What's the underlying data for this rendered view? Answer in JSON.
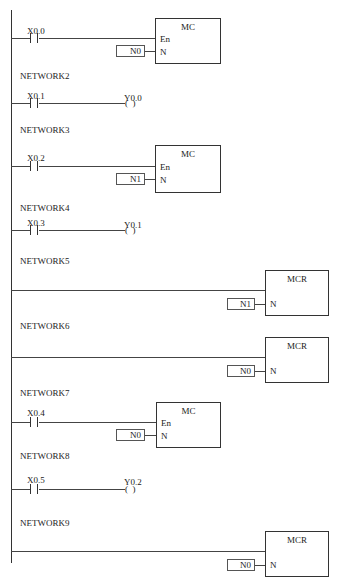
{
  "diagram": {
    "type": "PLC ladder diagram",
    "networks": [
      {
        "id": 1,
        "label": "",
        "contact": "X0.0",
        "instruction": "MC",
        "pins": [
          "En",
          "N"
        ],
        "param": "N0"
      },
      {
        "id": 2,
        "label": "NETWORK2",
        "contact": "X0.1",
        "coil": "Y0.0"
      },
      {
        "id": 3,
        "label": "NETWORK3",
        "contact": "X0.2",
        "instruction": "MC",
        "pins": [
          "En",
          "N"
        ],
        "param": "N1"
      },
      {
        "id": 4,
        "label": "NETWORK4",
        "contact": "X0.3",
        "coil": "Y0.1"
      },
      {
        "id": 5,
        "label": "NETWORK5",
        "instruction": "MCR",
        "pins": [
          "N"
        ],
        "param": "N1"
      },
      {
        "id": 6,
        "label": "NETWORK6",
        "instruction": "MCR",
        "pins": [
          "N"
        ],
        "param": "N0"
      },
      {
        "id": 7,
        "label": "NETWORK7",
        "contact": "X0.4",
        "instruction": "MC",
        "pins": [
          "En",
          "N"
        ],
        "param": "N0"
      },
      {
        "id": 8,
        "label": "NETWORK8",
        "contact": "X0.5",
        "coil": "Y0.2"
      },
      {
        "id": 9,
        "label": "NETWORK9",
        "instruction": "MCR",
        "pins": [
          "N"
        ],
        "param": "N0"
      }
    ],
    "coil_symbol": "(  )",
    "pin_en": "En",
    "pin_n": "N"
  }
}
